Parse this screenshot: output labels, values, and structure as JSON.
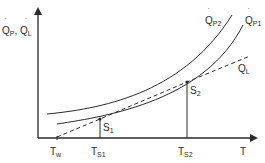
{
  "diagram": {
    "title": "",
    "y_axis_label": {
      "main": "Q",
      "sub1": "P",
      "sep": ", ",
      "main2": "Q",
      "sub2": "L"
    },
    "x_axis_label": "T",
    "curves": [
      {
        "id": "P2",
        "label_main": "Q",
        "label_sub": "P2",
        "style": "solid"
      },
      {
        "id": "P1",
        "label_main": "Q",
        "label_sub": "P1",
        "style": "solid"
      },
      {
        "id": "L",
        "label_main": "Q",
        "label_sub": "L",
        "style": "dashed"
      }
    ],
    "points": [
      {
        "id": "S1",
        "label_main": "S",
        "label_sub": "1"
      },
      {
        "id": "S2",
        "label_main": "S",
        "label_sub": "2"
      }
    ],
    "x_ticks": [
      {
        "main": "T",
        "sub": "w"
      },
      {
        "main": "T",
        "sub": "S1"
      },
      {
        "main": "T",
        "sub": "S2"
      }
    ],
    "colors": {
      "line": "#2a2a2a",
      "background": "#ffffff"
    }
  }
}
